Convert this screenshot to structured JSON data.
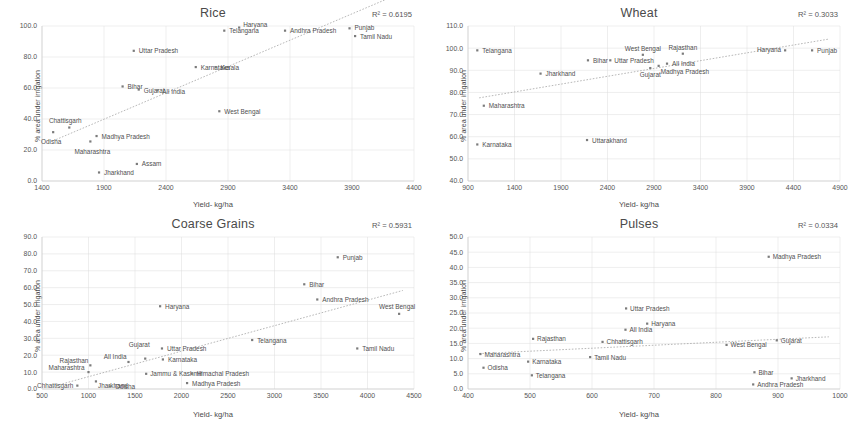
{
  "page": {
    "axis_x_label": "Yield- kg/ha",
    "axis_y_label": "% area under irrigation"
  },
  "chart_data": [
    {
      "id": "rice",
      "type": "scatter",
      "title": "Rice",
      "annotation": "R² = 0.6195",
      "r2": 0.6195,
      "xlabel": "Yield- kg/ha",
      "ylabel": "% area under irrigation",
      "xlim": [
        1400,
        4400
      ],
      "ylim": [
        0,
        100
      ],
      "xticks": [
        1400,
        1900,
        2400,
        2900,
        3400,
        3900,
        4400
      ],
      "yticks": [
        "0.0",
        "20.0",
        "40.0",
        "60.0",
        "80.0",
        "100.0"
      ],
      "grid": true,
      "trendline": true,
      "points": [
        {
          "label": "Odisha",
          "x": 1490,
          "y": 31.5,
          "lx": -2,
          "ly": 12,
          "anchor": "middle"
        },
        {
          "label": "Chattisgarh",
          "x": 1620,
          "y": 34.5,
          "lx": -4,
          "ly": -5,
          "anchor": "middle"
        },
        {
          "label": "Maharashtra",
          "x": 1790,
          "y": 25.5,
          "lx": 2,
          "ly": 13,
          "anchor": "middle"
        },
        {
          "label": "Madhya Pradesh",
          "x": 1840,
          "y": 29.0,
          "lx": 5,
          "ly": 2.5,
          "anchor": "start"
        },
        {
          "label": "Jharkhand",
          "x": 1860,
          "y": 5.5,
          "lx": 5,
          "ly": 2.5,
          "anchor": "start"
        },
        {
          "label": "Assam",
          "x": 2165,
          "y": 11.0,
          "lx": 5,
          "ly": 2.5,
          "anchor": "start"
        },
        {
          "label": "Bihar",
          "x": 2050,
          "y": 61.0,
          "lx": 5,
          "ly": 2.5,
          "anchor": "start"
        },
        {
          "label": "Gujarat",
          "x": 2180,
          "y": 59.0,
          "lx": 5,
          "ly": 3.5,
          "anchor": "start"
        },
        {
          "label": "All India",
          "x": 2330,
          "y": 58.5,
          "lx": 5,
          "ly": 4.0,
          "anchor": "start"
        },
        {
          "label": "Uttar Pradesh",
          "x": 2140,
          "y": 84.0,
          "lx": 5,
          "ly": 2.5,
          "anchor": "start"
        },
        {
          "label": "Karnataka",
          "x": 2640,
          "y": 73.5,
          "lx": 5,
          "ly": 2.5,
          "anchor": "start"
        },
        {
          "label": "Kerala",
          "x": 2800,
          "y": 73.5,
          "lx": 5,
          "ly": 2.5,
          "anchor": "start"
        },
        {
          "label": "West Bengal",
          "x": 2830,
          "y": 45.0,
          "lx": 5,
          "ly": 2.5,
          "anchor": "start"
        },
        {
          "label": "Telangana",
          "x": 2870,
          "y": 97.0,
          "lx": 5,
          "ly": 2.5,
          "anchor": "start"
        },
        {
          "label": "Haryana",
          "x": 2990,
          "y": 99.0,
          "lx": 4,
          "ly": -0.5,
          "anchor": "start"
        },
        {
          "label": "Andhra Pradesh",
          "x": 3360,
          "y": 97.0,
          "lx": 5,
          "ly": 2.5,
          "anchor": "start"
        },
        {
          "label": "Punjab",
          "x": 3880,
          "y": 98.5,
          "lx": 5,
          "ly": 2.0,
          "anchor": "start"
        },
        {
          "label": "Tamil Nadu",
          "x": 3925,
          "y": 93.5,
          "lx": 5,
          "ly": 3.0,
          "anchor": "start"
        }
      ]
    },
    {
      "id": "wheat",
      "type": "scatter",
      "title": "Wheat",
      "annotation": "R² = 0.3033",
      "r2": 0.3033,
      "xlabel": "Yield- kg/ha",
      "ylabel": "% area under irrigation",
      "xlim": [
        900,
        4900
      ],
      "ylim": [
        40,
        110
      ],
      "xticks": [
        900,
        1400,
        1900,
        2400,
        2900,
        3400,
        3900,
        4400,
        4900
      ],
      "yticks": [
        "40.0",
        "50.0",
        "60.0",
        "70.0",
        "80.0",
        "90.0",
        "100.0",
        "110.0"
      ],
      "grid": true,
      "trendline": true,
      "points": [
        {
          "label": "Karnataka",
          "x": 1000,
          "y": 56.5,
          "lx": 5,
          "ly": 2.5,
          "anchor": "start"
        },
        {
          "label": "Maharashtra",
          "x": 1070,
          "y": 74.0,
          "lx": 5,
          "ly": 2.5,
          "anchor": "start"
        },
        {
          "label": "Telangana",
          "x": 1000,
          "y": 99.0,
          "lx": 5,
          "ly": 2.5,
          "anchor": "start"
        },
        {
          "label": "Jharkhand",
          "x": 1680,
          "y": 88.5,
          "lx": 5,
          "ly": 2.5,
          "anchor": "start"
        },
        {
          "label": "Uttarakhand",
          "x": 2180,
          "y": 58.5,
          "lx": 5,
          "ly": 2.5,
          "anchor": "start"
        },
        {
          "label": "Bihar",
          "x": 2190,
          "y": 94.5,
          "lx": 5,
          "ly": 2.5,
          "anchor": "start"
        },
        {
          "label": "Uttar Pradesh",
          "x": 2430,
          "y": 94.5,
          "lx": 4,
          "ly": 2.5,
          "anchor": "start"
        },
        {
          "label": "West Bengal",
          "x": 2780,
          "y": 97.0,
          "lx": 0,
          "ly": -4,
          "anchor": "middle"
        },
        {
          "label": "Gujarat",
          "x": 2860,
          "y": 91.0,
          "lx": 0,
          "ly": 8.5,
          "anchor": "middle"
        },
        {
          "label": "Madhya Pradesh",
          "x": 2950,
          "y": 92.0,
          "lx": 2,
          "ly": 8.5,
          "anchor": "start"
        },
        {
          "label": "All India",
          "x": 3040,
          "y": 93.0,
          "lx": 5,
          "ly": 2.5,
          "anchor": "start"
        },
        {
          "label": "Rajasthan",
          "x": 3210,
          "y": 97.5,
          "lx": 0,
          "ly": -4,
          "anchor": "middle"
        },
        {
          "label": "Haryana",
          "x": 4310,
          "y": 99.0,
          "lx": -4,
          "ly": 2.0,
          "anchor": "end"
        },
        {
          "label": "Punjab",
          "x": 4600,
          "y": 99.0,
          "lx": 5,
          "ly": 2.5,
          "anchor": "start"
        }
      ]
    },
    {
      "id": "coarse-grains",
      "type": "scatter",
      "title": "Coarse Grains",
      "annotation": "R² = 0.5931",
      "r2": 0.5931,
      "xlabel": "Yield- kg/ha",
      "ylabel": "% area under irrigation",
      "xlim": [
        500,
        4500
      ],
      "ylim": [
        0,
        90
      ],
      "xticks": [
        500,
        1000,
        1500,
        2000,
        2500,
        3000,
        3500,
        4000,
        4500
      ],
      "yticks": [
        "0.0",
        "10.0",
        "20.0",
        "30.0",
        "40.0",
        "50.0",
        "60.0",
        "70.0",
        "80.0",
        "90.0"
      ],
      "grid": true,
      "trendline": true,
      "points": [
        {
          "label": "Chhattisgarh",
          "x": 880,
          "y": 2.0,
          "lx": -4,
          "ly": 2.5,
          "anchor": "end"
        },
        {
          "label": "Maharashtra",
          "x": 1000,
          "y": 10.0,
          "lx": -4,
          "ly": -2,
          "anchor": "end"
        },
        {
          "label": "Jharkhand",
          "x": 1080,
          "y": 4.5,
          "lx": 2,
          "ly": 7,
          "anchor": "start"
        },
        {
          "label": "Odisha",
          "x": 1230,
          "y": 1.5,
          "lx": 5,
          "ly": 2.5,
          "anchor": "start"
        },
        {
          "label": "Rajasthan",
          "x": 1020,
          "y": 14.0,
          "lx": -2,
          "ly": -2,
          "anchor": "end"
        },
        {
          "label": "All India",
          "x": 1430,
          "y": 16.0,
          "lx": -2,
          "ly": -3,
          "anchor": "end"
        },
        {
          "label": "Gujarat",
          "x": 1610,
          "y": 18.0,
          "lx": -6,
          "ly": -12,
          "anchor": "middle"
        },
        {
          "label": "Jammu & Kashmir",
          "x": 1620,
          "y": 9.0,
          "lx": 4,
          "ly": 2.5,
          "anchor": "start"
        },
        {
          "label": "Karnataka",
          "x": 1800,
          "y": 17.5,
          "lx": 5,
          "ly": 2.5,
          "anchor": "start"
        },
        {
          "label": "Uttar Pradesh",
          "x": 1790,
          "y": 24.0,
          "lx": 5,
          "ly": 2.5,
          "anchor": "start"
        },
        {
          "label": "Haryana",
          "x": 1770,
          "y": 49.0,
          "lx": 5,
          "ly": 2.5,
          "anchor": "start"
        },
        {
          "label": "Madhya Pradesh",
          "x": 2060,
          "y": 3.5,
          "lx": 5,
          "ly": 2.5,
          "anchor": "start"
        },
        {
          "label": "Himachal Pradesh",
          "x": 2110,
          "y": 9.0,
          "lx": 5,
          "ly": 2.5,
          "anchor": "start"
        },
        {
          "label": "Telangana",
          "x": 2760,
          "y": 29.0,
          "lx": 5,
          "ly": 2.5,
          "anchor": "start"
        },
        {
          "label": "Bihar",
          "x": 3320,
          "y": 62.0,
          "lx": 5,
          "ly": 2.5,
          "anchor": "start"
        },
        {
          "label": "Andhra Pradesh",
          "x": 3460,
          "y": 53.0,
          "lx": 5,
          "ly": 2.5,
          "anchor": "start"
        },
        {
          "label": "Punjab",
          "x": 3680,
          "y": 78.0,
          "lx": 5,
          "ly": 2.5,
          "anchor": "start"
        },
        {
          "label": "Tamil Nadu",
          "x": 3890,
          "y": 24.0,
          "lx": 5,
          "ly": 2.5,
          "anchor": "start"
        },
        {
          "label": "West Bengal",
          "x": 4340,
          "y": 44.5,
          "lx": -2,
          "ly": -5,
          "anchor": "middle"
        }
      ]
    },
    {
      "id": "pulses",
      "type": "scatter",
      "title": "Pulses",
      "annotation": "R² = 0.0334",
      "r2": 0.0334,
      "xlabel": "Yield- kg/ha",
      "ylabel": "% area under irrigation",
      "xlim": [
        400,
        1000
      ],
      "ylim": [
        0,
        50
      ],
      "xticks": [
        400,
        500,
        600,
        700,
        800,
        900,
        1000
      ],
      "yticks": [
        "0.0",
        "5.0",
        "10.0",
        "15.0",
        "20.0",
        "25.0",
        "30.0",
        "35.0",
        "40.0",
        "45.0",
        "50.0"
      ],
      "grid": true,
      "trendline": true,
      "points": [
        {
          "label": "Odisha",
          "x": 425,
          "y": 7.0,
          "lx": 4,
          "ly": 2.5,
          "anchor": "start"
        },
        {
          "label": "Maharashtra",
          "x": 420,
          "y": 11.5,
          "lx": 4,
          "ly": 2.5,
          "anchor": "start"
        },
        {
          "label": "Karnataka",
          "x": 497,
          "y": 9.0,
          "lx": 4,
          "ly": 2.5,
          "anchor": "start"
        },
        {
          "label": "Rajasthan",
          "x": 505,
          "y": 16.5,
          "lx": 4,
          "ly": 2.5,
          "anchor": "start"
        },
        {
          "label": "Telangana",
          "x": 503,
          "y": 4.5,
          "lx": 4,
          "ly": 2.5,
          "anchor": "start"
        },
        {
          "label": "Tamil Nadu",
          "x": 597,
          "y": 10.5,
          "lx": 4,
          "ly": 2.5,
          "anchor": "start"
        },
        {
          "label": "Chhattisgarh",
          "x": 617,
          "y": 15.5,
          "lx": 4,
          "ly": 2.5,
          "anchor": "start"
        },
        {
          "label": "All India",
          "x": 654,
          "y": 19.5,
          "lx": 4,
          "ly": 2.5,
          "anchor": "start"
        },
        {
          "label": "Uttar Pradesh",
          "x": 655,
          "y": 26.5,
          "lx": 4,
          "ly": 2.5,
          "anchor": "start"
        },
        {
          "label": "Haryana",
          "x": 689,
          "y": 21.5,
          "lx": 4,
          "ly": 2.5,
          "anchor": "start"
        },
        {
          "label": "West Bengal",
          "x": 817,
          "y": 14.5,
          "lx": 4,
          "ly": 2.5,
          "anchor": "start"
        },
        {
          "label": "Bihar",
          "x": 862,
          "y": 5.5,
          "lx": 4,
          "ly": 2.5,
          "anchor": "start"
        },
        {
          "label": "Andhra Pradesh",
          "x": 860,
          "y": 1.5,
          "lx": 4,
          "ly": 2.5,
          "anchor": "start"
        },
        {
          "label": "Madhya Pradesh",
          "x": 885,
          "y": 43.5,
          "lx": 4,
          "ly": 2.5,
          "anchor": "start"
        },
        {
          "label": "Gujarat",
          "x": 898,
          "y": 16.0,
          "lx": 4,
          "ly": 2.5,
          "anchor": "start"
        },
        {
          "label": "Jharkhand",
          "x": 922,
          "y": 3.5,
          "lx": 4,
          "ly": 2.5,
          "anchor": "start"
        }
      ]
    }
  ]
}
